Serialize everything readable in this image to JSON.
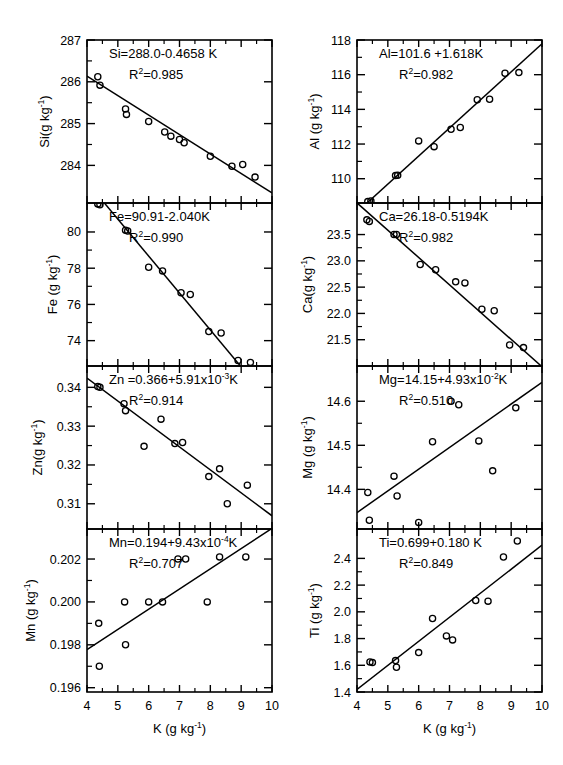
{
  "figure": {
    "xlabel": "K (g kg",
    "xlabel_sup": "-1",
    "xlabel_tail": ")",
    "x_axis": {
      "min": 4,
      "max": 10,
      "ticks": [
        4,
        5,
        6,
        7,
        8,
        9,
        10
      ]
    },
    "layout": {
      "columns": 2,
      "rows": 4
    }
  },
  "chart_data": [
    {
      "id": "si",
      "type": "scatter",
      "row": 0,
      "col": 0,
      "ylabel": "Si(g kg",
      "ylabel_sup": "-1",
      "ylabel_tail": ")",
      "equation": "Si=288.0-0.4658 K",
      "r2_prefix": "R",
      "r2_sup": "2",
      "r2_value": "=0.985",
      "xlabel": "K (g kg-1)",
      "xlim": [
        4,
        10
      ],
      "ylim": [
        283.1,
        287.0
      ],
      "yticks": [
        284,
        285,
        286,
        287
      ],
      "ytick_labels": [
        "284",
        "285",
        "286",
        "287"
      ],
      "slope": -0.4658,
      "intercept": 288.0,
      "points": [
        [
          4.35,
          286.12
        ],
        [
          4.42,
          285.92
        ],
        [
          5.25,
          285.35
        ],
        [
          5.28,
          285.22
        ],
        [
          6.0,
          285.05
        ],
        [
          6.52,
          284.8
        ],
        [
          6.72,
          284.7
        ],
        [
          7.0,
          284.62
        ],
        [
          7.15,
          284.54
        ],
        [
          8.0,
          284.22
        ],
        [
          8.7,
          283.98
        ],
        [
          9.05,
          284.02
        ],
        [
          9.45,
          283.72
        ]
      ]
    },
    {
      "id": "al",
      "type": "scatter",
      "row": 0,
      "col": 1,
      "ylabel": "Al (g kg",
      "ylabel_sup": "-1",
      "ylabel_tail": ")",
      "equation": "Al=101.6 +1.618K",
      "r2_prefix": "R",
      "r2_sup": "2",
      "r2_value": "=0.982",
      "xlim": [
        4,
        10
      ],
      "ylim": [
        108.6,
        118.0
      ],
      "yticks": [
        110,
        112,
        114,
        116,
        118
      ],
      "ytick_labels": [
        "110",
        "112",
        "114",
        "116",
        "118"
      ],
      "slope": 1.618,
      "intercept": 101.6,
      "points": [
        [
          4.35,
          108.68
        ],
        [
          4.45,
          108.72
        ],
        [
          5.25,
          110.18
        ],
        [
          5.32,
          110.2
        ],
        [
          6.0,
          112.18
        ],
        [
          6.5,
          111.85
        ],
        [
          7.05,
          112.85
        ],
        [
          7.35,
          112.95
        ],
        [
          7.9,
          114.55
        ],
        [
          8.3,
          114.58
        ],
        [
          8.8,
          116.08
        ],
        [
          9.25,
          116.12
        ]
      ]
    },
    {
      "id": "fe",
      "type": "scatter",
      "row": 1,
      "col": 0,
      "ylabel": "Fe (g kg",
      "ylabel_sup": "-1",
      "ylabel_tail": ")",
      "equation": "Fe=90.91-2.040K",
      "r2_prefix": "R",
      "r2_sup": "2",
      "r2_value": "=0.990",
      "xlim": [
        4,
        10
      ],
      "ylim": [
        72.6,
        81.6
      ],
      "yticks": [
        74,
        76,
        78,
        80
      ],
      "ytick_labels": [
        "74",
        "76",
        "78",
        "80"
      ],
      "slope": -2.04,
      "intercept": 90.91,
      "points": [
        [
          4.35,
          81.55
        ],
        [
          4.42,
          81.5
        ],
        [
          5.25,
          80.1
        ],
        [
          5.32,
          80.05
        ],
        [
          6.0,
          78.05
        ],
        [
          6.45,
          77.85
        ],
        [
          7.05,
          76.65
        ],
        [
          7.35,
          76.55
        ],
        [
          7.95,
          74.5
        ],
        [
          8.35,
          74.42
        ],
        [
          8.9,
          72.9
        ],
        [
          9.3,
          72.8
        ]
      ]
    },
    {
      "id": "ca",
      "type": "scatter",
      "row": 1,
      "col": 1,
      "ylabel": "Ca(g kg",
      "ylabel_sup": "-1",
      "ylabel_tail": ")",
      "equation": "Ca=26.18-0.5194K",
      "r2_prefix": "R",
      "r2_sup": "2",
      "r2_value": "=0.982",
      "xlim": [
        4,
        10
      ],
      "ylim": [
        21.0,
        24.1
      ],
      "yticks": [
        21.5,
        22.0,
        22.5,
        23.0,
        23.5
      ],
      "ytick_labels": [
        "21.5",
        "22.0",
        "22.5",
        "23.0",
        "23.5"
      ],
      "slope": -0.5194,
      "intercept": 26.18,
      "points": [
        [
          4.32,
          23.78
        ],
        [
          4.4,
          23.75
        ],
        [
          5.2,
          23.5
        ],
        [
          5.28,
          23.5
        ],
        [
          6.05,
          22.93
        ],
        [
          6.55,
          22.83
        ],
        [
          7.2,
          22.6
        ],
        [
          7.5,
          22.58
        ],
        [
          8.05,
          22.08
        ],
        [
          8.45,
          22.05
        ],
        [
          8.95,
          21.4
        ],
        [
          9.4,
          21.35
        ]
      ]
    },
    {
      "id": "zn",
      "type": "scatter",
      "row": 2,
      "col": 0,
      "ylabel": "Zn(g kg",
      "ylabel_sup": "-1",
      "ylabel_tail": ")",
      "equation": "Zn =0.366+5.91x10",
      "equation_sup": "-3",
      "equation_tail": "K",
      "r2_prefix": "R",
      "r2_sup": "2",
      "r2_value": "=0.914",
      "xlim": [
        4,
        10
      ],
      "ylim": [
        0.3035,
        0.3455
      ],
      "yticks": [
        0.31,
        0.32,
        0.33,
        0.34
      ],
      "ytick_labels": [
        "0.31",
        "0.32",
        "0.33",
        "0.34"
      ],
      "slope": -0.00591,
      "intercept": 0.366,
      "points": [
        [
          4.35,
          0.3402
        ],
        [
          4.42,
          0.34
        ],
        [
          5.2,
          0.3358
        ],
        [
          5.25,
          0.334
        ],
        [
          5.85,
          0.3248
        ],
        [
          6.4,
          0.3318
        ],
        [
          6.85,
          0.3255
        ],
        [
          7.1,
          0.3258
        ],
        [
          7.95,
          0.317
        ],
        [
          8.3,
          0.319
        ],
        [
          8.55,
          0.31
        ],
        [
          9.2,
          0.3148
        ]
      ]
    },
    {
      "id": "mg",
      "type": "scatter",
      "row": 2,
      "col": 1,
      "ylabel": "Mg (g kg",
      "ylabel_sup": "-1",
      "ylabel_tail": ")",
      "equation": "Mg=14.15+4.93x10",
      "equation_sup": "-2",
      "equation_tail": "K",
      "r2_prefix": "R",
      "r2_sup": "2",
      "r2_value": "=0.510",
      "xlim": [
        4,
        10
      ],
      "ylim": [
        14.31,
        14.68
      ],
      "yticks": [
        14.4,
        14.5,
        14.6
      ],
      "ytick_labels": [
        "14.4",
        "14.5",
        "14.6"
      ],
      "slope": 0.0493,
      "intercept": 14.15,
      "points": [
        [
          4.35,
          14.393
        ],
        [
          4.4,
          14.33
        ],
        [
          5.2,
          14.43
        ],
        [
          5.3,
          14.385
        ],
        [
          6.0,
          14.325
        ],
        [
          6.45,
          14.508
        ],
        [
          7.05,
          14.6
        ],
        [
          7.3,
          14.592
        ],
        [
          7.95,
          14.51
        ],
        [
          8.4,
          14.442
        ],
        [
          9.15,
          14.585
        ]
      ]
    },
    {
      "id": "mn",
      "type": "scatter",
      "row": 3,
      "col": 0,
      "ylabel": "Mn (g kg",
      "ylabel_sup": "-1",
      "ylabel_tail": ")",
      "equation": "Mn=0.194+9.43x10",
      "equation_sup": "-4",
      "equation_tail": "K",
      "r2_prefix": "R",
      "r2_sup": "2",
      "r2_value": "=0.707",
      "xlim": [
        4,
        10
      ],
      "ylim": [
        0.1958,
        0.2034
      ],
      "yticks": [
        0.196,
        0.198,
        0.2,
        0.202
      ],
      "ytick_labels": [
        "0.196",
        "0.198",
        "0.200",
        "0.202"
      ],
      "slope": 0.000943,
      "intercept": 0.194,
      "points": [
        [
          4.38,
          0.199
        ],
        [
          4.4,
          0.197
        ],
        [
          5.22,
          0.2
        ],
        [
          5.25,
          0.198
        ],
        [
          6.0,
          0.2
        ],
        [
          6.45,
          0.2
        ],
        [
          6.95,
          0.202
        ],
        [
          7.2,
          0.202
        ],
        [
          7.9,
          0.2
        ],
        [
          8.3,
          0.2021
        ],
        [
          9.15,
          0.2021
        ]
      ]
    },
    {
      "id": "ti",
      "type": "scatter",
      "row": 3,
      "col": 1,
      "ylabel": "Ti (g kg",
      "ylabel_sup": "-1",
      "ylabel_tail": ")",
      "equation": "Ti=0.699+0.180 K",
      "r2_prefix": "R",
      "r2_sup": "2",
      "r2_value": "=0.849",
      "xlim": [
        4,
        10
      ],
      "ylim": [
        1.4,
        2.62
      ],
      "yticks": [
        1.4,
        1.6,
        1.8,
        2.0,
        2.2,
        2.4
      ],
      "ytick_labels": [
        "1.4",
        "1.6",
        "1.8",
        "2.0",
        "2.2",
        "2.4"
      ],
      "slope": 0.18,
      "intercept": 0.699,
      "points": [
        [
          4.42,
          1.625
        ],
        [
          4.5,
          1.62
        ],
        [
          5.25,
          1.635
        ],
        [
          5.28,
          1.585
        ],
        [
          6.0,
          1.695
        ],
        [
          6.45,
          1.95
        ],
        [
          6.9,
          1.82
        ],
        [
          7.1,
          1.79
        ],
        [
          7.85,
          2.085
        ],
        [
          8.25,
          2.08
        ],
        [
          8.75,
          2.41
        ],
        [
          9.2,
          2.53
        ]
      ]
    }
  ]
}
